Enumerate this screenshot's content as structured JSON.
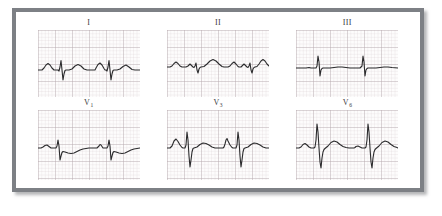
{
  "figure": {
    "kind": "12-lead-ecg-excerpt",
    "frame_color": "#7d8085",
    "background_color": "#ffffff",
    "trace_color": "#2b2b2d",
    "grid_minor_color": "#d9cfd2",
    "grid_major_color": "#b4a8ac",
    "panel_count": 6,
    "rows": 2,
    "columns": 3
  },
  "leads": [
    {
      "id": "lead-I",
      "label": "I",
      "label_main": "I",
      "label_sub": "",
      "row": 1,
      "column": 1,
      "description": "small upright P, sharp narrow QRS with S dip, rounded upright T",
      "beats": 2
    },
    {
      "id": "lead-II",
      "label": "II",
      "label_main": "II",
      "label_sub": "",
      "row": 1,
      "column": 2,
      "description": "low amplitude QRS, prominent broad upright T waves",
      "beats": 2
    },
    {
      "id": "lead-III",
      "label": "III",
      "label_main": "III",
      "label_sub": "",
      "row": 1,
      "column": 3,
      "description": "flat isoelectric baseline with narrow tall QRS spikes",
      "beats": 2
    },
    {
      "id": "lead-V1",
      "label": "V1",
      "label_main": "V",
      "label_sub": "1",
      "row": 2,
      "column": 1,
      "description": "rS pattern, small r wave with deeper S, shallow T",
      "beats": 2
    },
    {
      "id": "lead-V3",
      "label": "V3",
      "label_main": "V",
      "label_sub": "3",
      "row": 2,
      "column": 2,
      "description": "large RS complexes with deep S waves",
      "beats": 2
    },
    {
      "id": "lead-V6",
      "label": "V6",
      "label_main": "V",
      "label_sub": "6",
      "row": 2,
      "column": 3,
      "description": "tall R waves with deep S and broad upright T",
      "beats": 2
    }
  ],
  "chart_data": {
    "type": "line",
    "title": "",
    "xlabel": "",
    "ylabel": "",
    "grid": true,
    "grid_minor_px": 3.4,
    "grid_major_every": 5,
    "legend": "none",
    "xlim": [
      0,
      102
    ],
    "ylim": [
      0,
      67
    ],
    "series": [
      {
        "name": "I",
        "baseline_y": 40,
        "points": "0,40 4,40 6,38 8,35 10,33.5 12,35 14,38 16,40 18,40 20,40 21,41 22,37 23,30.5 24,40 25,50 26,44 27,40.5 28,40 31,40 34,39 37,36 40,34.5 43,36 46,39 49,40 52,40 54,40 56,40 57,40 58,38 60,34.5 62,33 64,35 66,38.5 67,40 68,40 69,41 70,37 71,30.5 72,40 73,50 74,44 75,40.5 76,40 79,40 82,39 85,36.5 88,35 91,37 94,39.5 97,40 102,40"
      },
      {
        "name": "II",
        "baseline_y": 37,
        "points": "0,37 3,37 5,36 7,33.5 9,32 11,33.5 13,36 15,37 17,37 19,37 21,36 23,34 25,36 26,37 27,37.5 28,36 29,33 30,40 31,43 32,39 33,37.5 34,37 37,36.5 40,34 43,31 46,29.5 49,31 52,34 55,36.5 57,37 59,37 61,37 63,36 65,33.5 67,32 69,34 71,36.5 72,37 74,37 75,36 77,34 79,36 80,37 81,37.5 82,36 83,33 84,40 85,43 86,39 87,37.5 88,37 90,36.5 92,34 94,31 96,29.5 98,31 100,34 102,36"
      },
      {
        "name": "III",
        "baseline_y": 38,
        "points": "0,38 6,38 10,38 13,37.5 15,38 17,38 19,38 20,38 21,36 22,26 23,32 24,46 25,40 26,38.5 27,38 30,38 34,38 38,37.5 42,37 46,37 50,37.5 54,38 58,38 62,38 64,38 65,37 66,36 67,26 68,32 69,46 70,40 71,38.5 72,38 76,38 80,38 84,37.5 88,37 92,37 96,37.5 102,38"
      },
      {
        "name": "V1",
        "baseline_y": 38,
        "points": "0,38 3,38 5,37 7,35.5 9,35 11,36.5 13,38 15,38 17,38 18,38 19,36 20,30 21,36 22,50 23,46 24,42.5 25,41.5 27,42 30,43 33,43.5 36,43 39,41.5 42,40 45,39 48,38.5 51,38 54,38 57,38 59,38 60,37 61,36 62,34.5 63,35 64,36.5 65,38 66,38 68,38 69,38 70,36 71,30 72,36 73,50 74,46 75,42.5 76,41.5 78,42 81,43 84,43.5 87,43 90,41.5 93,40 96,39 99,38.5 102,38"
      },
      {
        "name": "V3",
        "baseline_y": 38,
        "points": "0,38 3,38 5,36 7,31 9,29 11,31.5 13,35 15,37.5 16,38 17,38 18,38 19,35 20,22 21,30 22,46 23,57 24,50 25,42 26,38.5 27,38 30,37 33,34.5 36,33 39,33.5 42,35 45,37 48,38 51,38 54,38 56,38 57,37 58,34 59,30 60,28.5 61,31 63,35 65,37.5 66,38 68,38 69,38 70,35 71,22 72,30 73,46 74,57 75,50 76,42 77,38.5 78,38 81,37 84,34.5 87,33 90,33.5 93,35 96,37 99,38 102,38"
      },
      {
        "name": "V6",
        "baseline_y": 38,
        "points": "0,38 3,38 5,37 7,34.5 9,33.5 11,35 13,37 15,38 17,38 18,38 19,37 20,30 21,14 22,22 23,38 24,52 25,58 26,48 27,42 28,39.5 29,38.5 32,36 35,32.5 38,31 41,32 44,34.5 47,36.5 50,37.5 53,38 56,38 58,38 59,37.5 60,36.5 62,36 64,37 66,38 68,38 69,38 70,37 71,30 72,14 73,22 74,38 75,52 76,58 77,48 78,42 79,39.5 80,38.5 83,36 86,32.5 89,31 92,32 95,34.5 98,36.5 101,37.5 102,38"
      }
    ]
  }
}
